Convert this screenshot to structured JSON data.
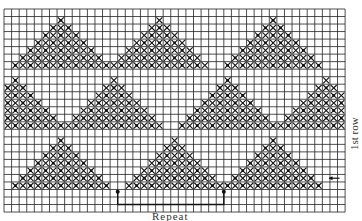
{
  "chart_title": "",
  "grid": {
    "columns": 45,
    "rows": 27,
    "origin_x": 4,
    "origin_y": 9,
    "cell_w": 7.58,
    "cell_h": 7.52,
    "line_color": "#222222",
    "cross_color": "#111111"
  },
  "motif": {
    "name": "triangle",
    "height_rows": 7,
    "description": "filled triangles of cross-stitch (X) marks with dots"
  },
  "bands": [
    {
      "base_row": 7,
      "apex_cols": [
        7,
        20,
        35
      ]
    },
    {
      "base_row": 15,
      "apex_cols": [
        1,
        14,
        29,
        42
      ]
    },
    {
      "base_row": 23,
      "apex_cols": [
        7,
        22,
        35
      ]
    }
  ],
  "repeat": {
    "start_col": 15,
    "end_col": 29,
    "marker_row": 24,
    "label": "Repeat"
  },
  "first_row": {
    "label": "1st row",
    "arrow": "←",
    "arrow_row": 22
  }
}
